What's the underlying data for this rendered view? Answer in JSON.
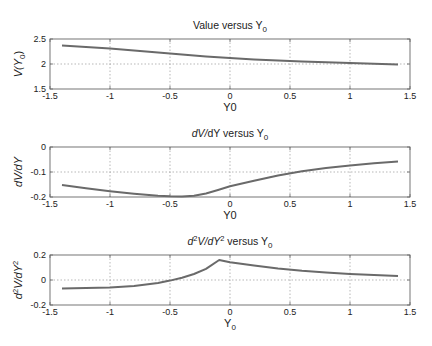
{
  "chart_data": [
    {
      "type": "line",
      "title": "Value versus Y0",
      "title_parts": {
        "main": "Value versus Y",
        "sub": "0"
      },
      "xlabel": "Y0",
      "ylabel": "V(Y0)",
      "ylabel_parts": {
        "pre": "V(Y",
        "sub": "0",
        "post": ")"
      },
      "xlim": [
        -1.5,
        1.5
      ],
      "ylim": [
        1.5,
        2.5
      ],
      "xticks": [
        "-1.5",
        "-1",
        "-0.5",
        "0",
        "0.5",
        "1",
        "1.5"
      ],
      "yticks": [
        "1.5",
        "2",
        "2.5"
      ],
      "grid": true,
      "series": [
        {
          "name": "V",
          "x": [
            -1.4,
            -1.2,
            -1.0,
            -0.8,
            -0.6,
            -0.4,
            -0.2,
            0.0,
            0.2,
            0.4,
            0.6,
            0.8,
            1.0,
            1.2,
            1.4
          ],
          "values": [
            2.37,
            2.34,
            2.31,
            2.27,
            2.23,
            2.19,
            2.15,
            2.12,
            2.09,
            2.07,
            2.05,
            2.035,
            2.02,
            2.005,
            1.99
          ]
        }
      ]
    },
    {
      "type": "line",
      "title": "dV/dY versus Y0",
      "title_parts": {
        "main": "dV/dY versus Y",
        "sub": "0"
      },
      "xlabel": "Y0",
      "ylabel": "dV/dY",
      "xlim": [
        -1.5,
        1.5
      ],
      "ylim": [
        -0.2,
        0
      ],
      "xticks": [
        "-1.5",
        "-1",
        "-0.5",
        "0",
        "0.5",
        "1",
        "1.5"
      ],
      "yticks": [
        "-0.2",
        "-0.1",
        "0"
      ],
      "grid": true,
      "series": [
        {
          "name": "dV/dY",
          "x": [
            -1.4,
            -1.2,
            -1.0,
            -0.8,
            -0.6,
            -0.5,
            -0.4,
            -0.3,
            -0.2,
            -0.1,
            0.0,
            0.2,
            0.4,
            0.6,
            0.8,
            1.0,
            1.2,
            1.4
          ],
          "values": [
            -0.152,
            -0.165,
            -0.177,
            -0.187,
            -0.195,
            -0.197,
            -0.198,
            -0.195,
            -0.186,
            -0.172,
            -0.157,
            -0.135,
            -0.114,
            -0.097,
            -0.084,
            -0.074,
            -0.065,
            -0.058
          ]
        }
      ]
    },
    {
      "type": "line",
      "title": "d2V/dY2 versus Y0",
      "title_parts": {
        "d": "d",
        "sup1": "2",
        "mid": "V/dY",
        "sup2": "2",
        "main": " versus Y",
        "sub": "0"
      },
      "xlabel": "Y0",
      "xlabel_parts": {
        "main": "Y",
        "sub": "0"
      },
      "ylabel": "d2V/dY2",
      "ylabel_parts": {
        "d": "d",
        "sup1": "2",
        "mid": "V/dY",
        "sup2": "2"
      },
      "xlim": [
        -1.5,
        1.5
      ],
      "ylim": [
        -0.2,
        0.2
      ],
      "xticks": [
        "-1.5",
        "-1",
        "-0.5",
        "0",
        "0.5",
        "1",
        "1.5"
      ],
      "yticks": [
        "-0.2",
        "0",
        "0.2"
      ],
      "grid": true,
      "series": [
        {
          "name": "d2V/dY2",
          "x": [
            -1.4,
            -1.2,
            -1.0,
            -0.8,
            -0.6,
            -0.5,
            -0.4,
            -0.3,
            -0.2,
            -0.09,
            0.0,
            0.2,
            0.4,
            0.6,
            0.8,
            1.0,
            1.2,
            1.4
          ],
          "values": [
            -0.068,
            -0.065,
            -0.06,
            -0.048,
            -0.025,
            -0.005,
            0.018,
            0.048,
            0.09,
            0.16,
            0.142,
            0.115,
            0.092,
            0.074,
            0.06,
            0.048,
            0.039,
            0.032
          ]
        }
      ]
    }
  ],
  "style": {
    "line_color": "#6a6a6a",
    "axis_color": "#666666",
    "grid_color": "#9a9a9a",
    "background": "#ffffff"
  }
}
